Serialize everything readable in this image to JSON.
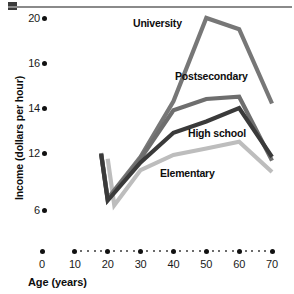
{
  "chart_data": {
    "type": "line",
    "title": "",
    "xlabel": "Age (years)",
    "ylabel": "Income (dollars per hour)",
    "x_ticks": [
      0,
      10,
      20,
      30,
      40,
      50,
      60,
      70
    ],
    "x_tick_labels": [
      "0",
      "10",
      "20",
      "30",
      "40",
      "50",
      "60",
      "70"
    ],
    "y_ticks": [
      6,
      12,
      14,
      16,
      20
    ],
    "y_tick_labels": [
      "20",
      "16",
      "14",
      "12",
      "6"
    ],
    "xlim": [
      0,
      70
    ],
    "ylim": [
      6,
      20
    ],
    "grid": false,
    "legend": "inline-annotations",
    "x": [
      20,
      30,
      40,
      50,
      60,
      70
    ],
    "series": [
      {
        "name": "University",
        "color": "#777777",
        "x": [
          18,
          20,
          30,
          40,
          50,
          60,
          70
        ],
        "values": [
          12.0,
          7.2,
          11.6,
          14.3,
          20.0,
          19.0,
          14.2
        ]
      },
      {
        "name": "Postsecondary",
        "color": "#6e6e6e",
        "x": [
          18,
          20,
          30,
          40,
          50,
          60,
          70
        ],
        "values": [
          11.9,
          7.1,
          11.4,
          13.9,
          14.4,
          14.5,
          11.2
        ]
      },
      {
        "name": "High school",
        "color": "#3a3a3a",
        "x": [
          18,
          20,
          30,
          40,
          50,
          60,
          70
        ],
        "values": [
          11.9,
          7.0,
          11.0,
          12.9,
          13.4,
          14.0,
          11.6
        ]
      },
      {
        "name": "Elementary",
        "color": "#bdbdbd",
        "x": [
          20,
          22,
          30,
          40,
          50,
          60,
          70
        ],
        "values": [
          11.4,
          6.5,
          10.2,
          11.8,
          12.2,
          12.5,
          10.0
        ]
      }
    ]
  },
  "axis": {
    "y_title": "Income (dollars per hour)",
    "x_title": "Age (years)"
  },
  "annotations": {
    "university": "University",
    "postsecondary": "Postsecondary",
    "high_school": "High school",
    "elementary": "Elementary"
  },
  "colors": {
    "university": "#777777",
    "postsecondary": "#6e6e6e",
    "high_school": "#3a3a3a",
    "elementary": "#bdbdbd",
    "axis": "#111111",
    "rule": "#8a8a8a"
  }
}
